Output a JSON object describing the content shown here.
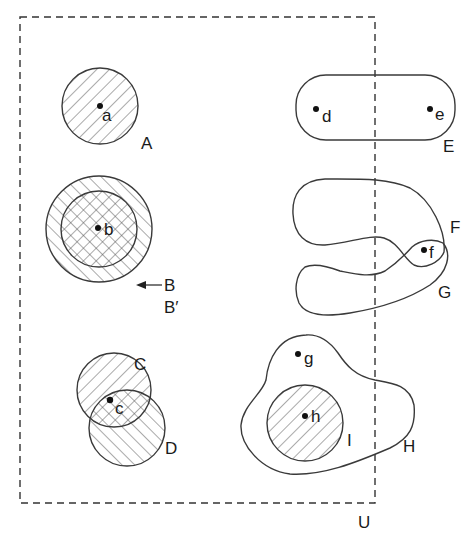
{
  "diagram": {
    "universe": {
      "label": "U",
      "style": "dashed-rectangle"
    },
    "sets": [
      {
        "id": "A",
        "label": "A",
        "shape": "circle",
        "fill": "hatched",
        "contains_points": [
          "a"
        ]
      },
      {
        "id": "B",
        "label": "B",
        "shape": "circle",
        "fill": "crosshatched",
        "contains_points": [
          "b"
        ],
        "note": "inner circle, indicated by arrow"
      },
      {
        "id": "B_prime",
        "label": "B′",
        "shape": "circle",
        "fill": "hatched",
        "contains_points": [
          "b"
        ],
        "note": "outer circle concentric with B"
      },
      {
        "id": "C",
        "label": "C",
        "shape": "circle",
        "fill": "hatched",
        "contains_points": [
          "c"
        ]
      },
      {
        "id": "D",
        "label": "D",
        "shape": "circle",
        "fill": "hatched",
        "contains_points": [
          "c"
        ]
      },
      {
        "id": "E",
        "label": "E",
        "shape": "stadium",
        "fill": "none",
        "contains_points": [
          "d",
          "e"
        ],
        "note": "crosses boundary of U; e lies outside U"
      },
      {
        "id": "F",
        "label": "F",
        "shape": "closed-curve",
        "fill": "none",
        "contains_points": [
          "f"
        ]
      },
      {
        "id": "G",
        "label": "G",
        "shape": "closed-curve",
        "fill": "none",
        "contains_points": [
          "f"
        ]
      },
      {
        "id": "H",
        "label": "H",
        "shape": "blob",
        "fill": "none",
        "contains_points": [
          "g",
          "h"
        ]
      },
      {
        "id": "I",
        "label": "I",
        "shape": "circle",
        "fill": "hatched",
        "contains_points": [
          "h"
        ],
        "note": "subset of H"
      }
    ],
    "points": [
      {
        "id": "a",
        "label": "a"
      },
      {
        "id": "b",
        "label": "b"
      },
      {
        "id": "c",
        "label": "c"
      },
      {
        "id": "d",
        "label": "d"
      },
      {
        "id": "e",
        "label": "e"
      },
      {
        "id": "f",
        "label": "f"
      },
      {
        "id": "g",
        "label": "g"
      },
      {
        "id": "h",
        "label": "h"
      }
    ]
  },
  "labels": {
    "U": "U",
    "A": "A",
    "B": "B",
    "B_prime": "B′",
    "C": "C",
    "D": "D",
    "E": "E",
    "F": "F",
    "G": "G",
    "H": "H",
    "I": "I",
    "a": "a",
    "b": "b",
    "c": "c",
    "d": "d",
    "e": "e",
    "f": "f",
    "g": "g",
    "h": "h"
  }
}
